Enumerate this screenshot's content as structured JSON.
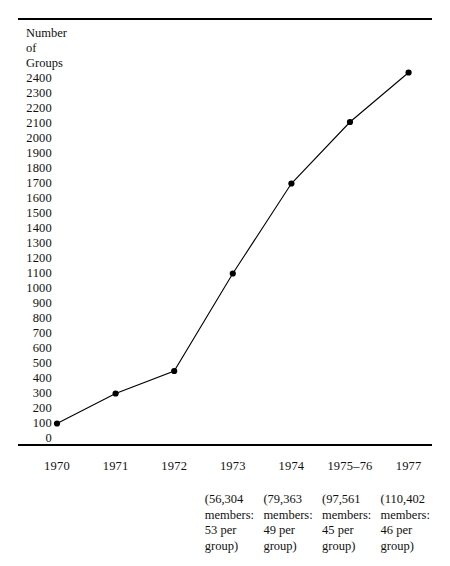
{
  "figure": {
    "y_axis_title_lines": [
      "Number",
      "of",
      "Groups"
    ],
    "rule_color": "#000000",
    "line_color": "#000000",
    "marker_color": "#000000"
  },
  "chart_data": {
    "type": "line",
    "title": "",
    "xlabel": "",
    "ylabel": "Number of Groups",
    "categories": [
      "1970",
      "1971",
      "1972",
      "1973",
      "1974",
      "1975–76",
      "1977"
    ],
    "values": [
      100,
      300,
      450,
      1100,
      1700,
      2110,
      2440
    ],
    "ylim": [
      0,
      2400
    ],
    "ytick_step": 100,
    "yticks": [
      "2400",
      "2300",
      "2200",
      "2100",
      "2000",
      "1900",
      "1800",
      "1700",
      "1600",
      "1500",
      "1400",
      "1300",
      "1200",
      "1100",
      "1000",
      "900",
      "800",
      "700",
      "600",
      "500",
      "400",
      "300",
      "200",
      "100",
      "0"
    ],
    "grid": false,
    "legend": "none",
    "markers": "filled-circle",
    "annotations": [
      {
        "category": "1973",
        "lines": [
          "(56,304",
          "members:",
          "53 per",
          "group)"
        ],
        "members": 56304,
        "members_per_group": 53
      },
      {
        "category": "1974",
        "lines": [
          "(79,363",
          "members:",
          "49 per",
          "group)"
        ],
        "members": 79363,
        "members_per_group": 49
      },
      {
        "category": "1975–76",
        "lines": [
          "(97,561",
          "members:",
          "45 per",
          "group)"
        ],
        "members": 97561,
        "members_per_group": 45
      },
      {
        "category": "1977",
        "lines": [
          "(110,402",
          "members:",
          "46 per",
          "group)"
        ],
        "members": 110402,
        "members_per_group": 46
      }
    ]
  }
}
